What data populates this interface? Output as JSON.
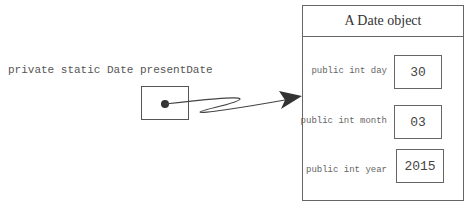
{
  "variable": {
    "declaration": "private static Date presentDate"
  },
  "object": {
    "title": "A Date object",
    "fields": [
      {
        "label": "public int day",
        "value": "30"
      },
      {
        "label": "public int month",
        "value": "03"
      },
      {
        "label": "public int year",
        "value": "2015"
      }
    ]
  }
}
